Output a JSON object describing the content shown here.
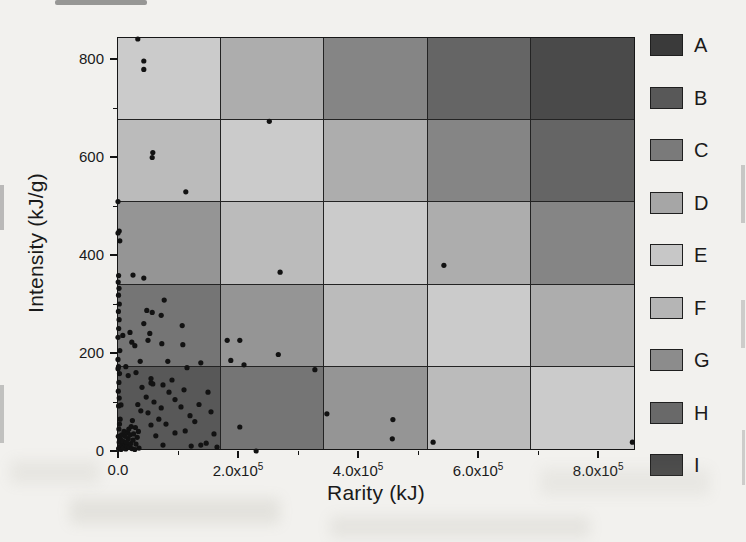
{
  "figure": {
    "paper_color": "#f2f1ee",
    "point_color": "#121212",
    "grid_line_color": "#232323"
  },
  "chart_data": {
    "type": "scatter",
    "title": "",
    "xlabel": "Rarity (kJ)",
    "ylabel": "Intensity (kJ/g)",
    "xlim": [
      0,
      863000
    ],
    "ylim": [
      0,
      843
    ],
    "grid_on": true,
    "legend_position": "right-outside",
    "x_major_ticks": [
      {
        "value": 0,
        "label": "0.0"
      },
      {
        "value": 200000,
        "label": "2.0x10",
        "sup": "5"
      },
      {
        "value": 400000,
        "label": "4.0x10",
        "sup": "5"
      },
      {
        "value": 600000,
        "label": "6.0x10",
        "sup": "5"
      },
      {
        "value": 800000,
        "label": "8.0x10",
        "sup": "5"
      }
    ],
    "x_minor_ticks": [
      100000,
      300000,
      500000,
      700000
    ],
    "y_major_ticks": [
      {
        "value": 0,
        "label": "0"
      },
      {
        "value": 200,
        "label": "200"
      },
      {
        "value": 400,
        "label": "400"
      },
      {
        "value": 600,
        "label": "600"
      },
      {
        "value": 800,
        "label": "800"
      }
    ],
    "y_minor_ticks": [
      100,
      300,
      500,
      700
    ],
    "legend": [
      {
        "label": "A",
        "color": "#3a3a3a"
      },
      {
        "label": "B",
        "color": "#585858"
      },
      {
        "label": "C",
        "color": "#7a7a7a"
      },
      {
        "label": "D",
        "color": "#a6a6a6"
      },
      {
        "label": "E",
        "color": "#c7c7c7"
      },
      {
        "label": "F",
        "color": "#b5b5b5"
      },
      {
        "label": "G",
        "color": "#8c8c8c"
      },
      {
        "label": "H",
        "color": "#696969"
      },
      {
        "label": "I",
        "color": "#4a4a4a"
      }
    ],
    "grid": {
      "rows": 5,
      "cols": 5,
      "cell_classes": [
        [
          "E",
          "D",
          "C",
          "B",
          "A"
        ],
        [
          "F",
          "E",
          "D",
          "C",
          "B"
        ],
        [
          "G",
          "F",
          "E",
          "D",
          "C"
        ],
        [
          "H",
          "G",
          "F",
          "E",
          "D"
        ],
        [
          "I",
          "H",
          "G",
          "F",
          "E"
        ]
      ]
    },
    "points": [
      [
        33000,
        841
      ],
      [
        43000,
        796
      ],
      [
        43000,
        779
      ],
      [
        252000,
        673
      ],
      [
        58000,
        609
      ],
      [
        57000,
        599
      ],
      [
        113000,
        529
      ],
      [
        0,
        509
      ],
      [
        2000,
        449
      ],
      [
        3000,
        429
      ],
      [
        0,
        445
      ],
      [
        543000,
        379
      ],
      [
        270000,
        365
      ],
      [
        25000,
        359
      ],
      [
        43000,
        353
      ],
      [
        77000,
        308
      ],
      [
        48000,
        287
      ],
      [
        57000,
        283
      ],
      [
        72000,
        277
      ],
      [
        43000,
        260
      ],
      [
        107000,
        256
      ],
      [
        20000,
        242
      ],
      [
        53000,
        240
      ],
      [
        8000,
        236
      ],
      [
        0,
        232
      ],
      [
        73000,
        219
      ],
      [
        50000,
        226
      ],
      [
        23000,
        222
      ],
      [
        28000,
        215
      ],
      [
        108000,
        217
      ],
      [
        3000,
        205
      ],
      [
        0,
        187
      ],
      [
        37000,
        183
      ],
      [
        83000,
        183
      ],
      [
        138000,
        180
      ],
      [
        13000,
        172
      ],
      [
        115000,
        170
      ],
      [
        0,
        168
      ],
      [
        182000,
        226
      ],
      [
        203000,
        226
      ],
      [
        267000,
        197
      ],
      [
        188000,
        185
      ],
      [
        210000,
        176
      ],
      [
        328000,
        166
      ],
      [
        17000,
        154
      ],
      [
        55000,
        139
      ],
      [
        58000,
        137
      ],
      [
        75000,
        135
      ],
      [
        5000,
        94
      ],
      [
        38000,
        82
      ],
      [
        50000,
        78
      ],
      [
        120000,
        72
      ],
      [
        55000,
        53
      ],
      [
        63000,
        31
      ],
      [
        95000,
        37
      ],
      [
        112000,
        41
      ],
      [
        75000,
        12
      ],
      [
        122000,
        10
      ],
      [
        138000,
        12
      ],
      [
        147000,
        16
      ],
      [
        33000,
        95
      ],
      [
        47000,
        110
      ],
      [
        60000,
        100
      ],
      [
        72000,
        88
      ],
      [
        85000,
        120
      ],
      [
        40000,
        130
      ],
      [
        95000,
        105
      ],
      [
        55000,
        148
      ],
      [
        30000,
        160
      ],
      [
        68000,
        65
      ],
      [
        80000,
        55
      ],
      [
        105000,
        90
      ],
      [
        90000,
        145
      ],
      [
        110000,
        125
      ],
      [
        128000,
        60
      ],
      [
        135000,
        95
      ],
      [
        150000,
        120
      ],
      [
        160000,
        35
      ],
      [
        165000,
        8
      ],
      [
        155000,
        80
      ],
      [
        1000,
        92
      ],
      [
        2000,
        108
      ],
      [
        500,
        122
      ],
      [
        1500,
        140
      ],
      [
        2500,
        158
      ],
      [
        800,
        172
      ],
      [
        1200,
        250
      ],
      [
        1800,
        268
      ],
      [
        600,
        285
      ],
      [
        2200,
        300
      ],
      [
        900,
        318
      ],
      [
        1600,
        332
      ],
      [
        400,
        345
      ],
      [
        1000,
        358
      ],
      [
        1000,
        5
      ],
      [
        3000,
        8
      ],
      [
        5000,
        3
      ],
      [
        7000,
        12
      ],
      [
        2000,
        18
      ],
      [
        9000,
        6
      ],
      [
        11000,
        15
      ],
      [
        4000,
        25
      ],
      [
        13000,
        4
      ],
      [
        6000,
        33
      ],
      [
        15000,
        10
      ],
      [
        8000,
        20
      ],
      [
        17000,
        25
      ],
      [
        10000,
        40
      ],
      [
        1500,
        45
      ],
      [
        12000,
        30
      ],
      [
        19000,
        8
      ],
      [
        14000,
        18
      ],
      [
        2500,
        55
      ],
      [
        16000,
        38
      ],
      [
        21000,
        15
      ],
      [
        18000,
        45
      ],
      [
        500,
        30
      ],
      [
        20000,
        33
      ],
      [
        23000,
        5
      ],
      [
        25000,
        22
      ],
      [
        3500,
        65
      ],
      [
        22000,
        50
      ],
      [
        28000,
        3
      ],
      [
        30000,
        14
      ],
      [
        26000,
        35
      ],
      [
        32000,
        28
      ],
      [
        35000,
        6
      ],
      [
        29000,
        48
      ],
      [
        24000,
        62
      ],
      [
        34000,
        40
      ],
      [
        230000,
        0
      ],
      [
        203000,
        49
      ],
      [
        348000,
        76
      ],
      [
        458000,
        64
      ],
      [
        457000,
        25
      ],
      [
        525000,
        18
      ],
      [
        857000,
        18
      ]
    ]
  }
}
